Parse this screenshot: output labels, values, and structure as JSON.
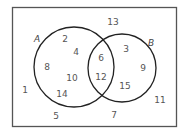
{
  "diagram": {
    "type": "venn",
    "universe": {
      "x": 12,
      "y": 7,
      "width": 164,
      "height": 119
    },
    "sets": [
      {
        "name": "A",
        "label": "A",
        "cx": 74,
        "cy": 67,
        "r": 40,
        "label_x": 34,
        "label_y": 42
      },
      {
        "name": "B",
        "label": "B",
        "cx": 122,
        "cy": 68,
        "r": 34,
        "label_x": 148,
        "label_y": 46
      }
    ],
    "regions": {
      "A_only": [
        "2",
        "4",
        "8",
        "10",
        "14"
      ],
      "A_and_B": [
        "6",
        "12"
      ],
      "B_only": [
        "3",
        "9",
        "15"
      ],
      "neither": [
        "1",
        "5",
        "7",
        "11",
        "13"
      ]
    },
    "numbers": [
      {
        "value": "2",
        "x": 65,
        "y": 42
      },
      {
        "value": "4",
        "x": 76,
        "y": 55
      },
      {
        "value": "8",
        "x": 47,
        "y": 70
      },
      {
        "value": "10",
        "x": 72,
        "y": 81
      },
      {
        "value": "14",
        "x": 62,
        "y": 97
      },
      {
        "value": "6",
        "x": 101,
        "y": 61
      },
      {
        "value": "12",
        "x": 101,
        "y": 80
      },
      {
        "value": "3",
        "x": 126,
        "y": 52
      },
      {
        "value": "9",
        "x": 143,
        "y": 71
      },
      {
        "value": "15",
        "x": 125,
        "y": 89
      },
      {
        "value": "13",
        "x": 113,
        "y": 25
      },
      {
        "value": "1",
        "x": 25,
        "y": 93
      },
      {
        "value": "5",
        "x": 56,
        "y": 119
      },
      {
        "value": "7",
        "x": 114,
        "y": 118
      },
      {
        "value": "11",
        "x": 160,
        "y": 103
      }
    ]
  }
}
